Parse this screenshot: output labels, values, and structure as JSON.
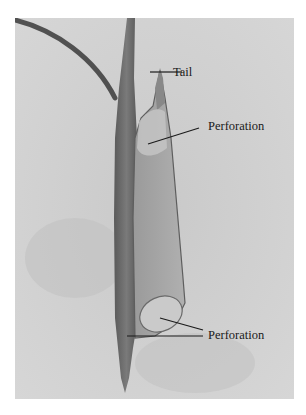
{
  "figure": {
    "type": "labeled micrograph",
    "labels": [
      {
        "id": "tail",
        "text": "Tail"
      },
      {
        "id": "perforation-top",
        "text": "Perforation"
      },
      {
        "id": "perforation-bottom",
        "text": "Perforation"
      }
    ],
    "colors": {
      "background": "#cfcfcf",
      "border": "#ffffff",
      "cell_wall": "#6b6b6b",
      "cell_body": "#a9a9a9",
      "perforation": "#c4c4c4",
      "leader_line": "#1a1a1a"
    }
  }
}
